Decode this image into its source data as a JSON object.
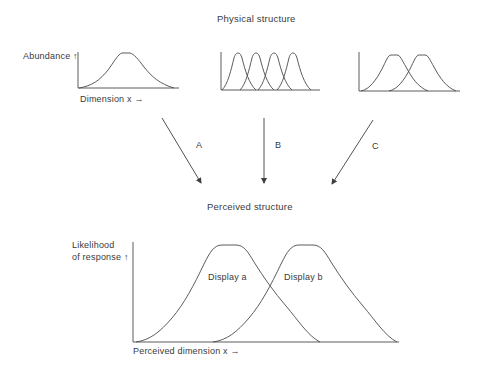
{
  "diagram": {
    "physical_title": "Physical structure",
    "perceived_title": "Perceived structure",
    "panels": [
      {
        "id": "panel-1",
        "y_label": "Abundance ↑",
        "x_label": "Dimension x →",
        "peaks": 1
      },
      {
        "id": "panel-2",
        "y_label": "",
        "x_label": "",
        "peaks": 4
      },
      {
        "id": "panel-3",
        "y_label": "",
        "x_label": "",
        "peaks": 2
      }
    ],
    "arrows": [
      {
        "label": "A",
        "from": "panel-1",
        "to": "perceived"
      },
      {
        "label": "B",
        "from": "panel-2",
        "to": "perceived"
      },
      {
        "label": "C",
        "from": "panel-3",
        "to": "perceived"
      }
    ],
    "perceived": {
      "y_label_line1": "Likelihood",
      "y_label_line2": "of response ↑",
      "x_label": "Perceived dimension x →",
      "curves": [
        {
          "label": "Display a"
        },
        {
          "label": "Display b"
        }
      ]
    }
  },
  "colors": {
    "line": "#4a4a4a",
    "text": "#3a3a3a",
    "background": "#ffffff"
  }
}
